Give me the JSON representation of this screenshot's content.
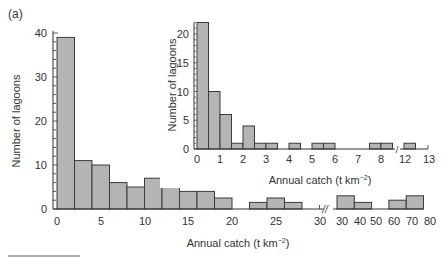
{
  "chart_data": [
    {
      "panel": "(a)",
      "type": "bar",
      "title": "",
      "xlabel": "Annual catch (t km−2)",
      "ylabel": "Number of lagoons",
      "ylim": [
        0,
        40
      ],
      "yticks": [
        0,
        10,
        20,
        30,
        40
      ],
      "xticks": [
        "0",
        "5",
        "10",
        "15",
        "20",
        "25",
        "30",
        "30",
        "40",
        "50",
        "60",
        "70",
        "80"
      ],
      "axis_break": "between 30 and 30 (scale changes from 2-unit bins to 10-unit bins)",
      "bins": [
        "0-2",
        "2-4",
        "4-6",
        "6-8",
        "8-10",
        "10-12",
        "12-14",
        "14-16",
        "16-18",
        "18-20",
        "20-22",
        "22-24",
        "24-26",
        "26-28",
        "30-40",
        "40-50",
        "50-60",
        "60-70",
        "70-80"
      ],
      "values": [
        39,
        11,
        10,
        6,
        5,
        7,
        5.5,
        4,
        4,
        2.5,
        0,
        1.5,
        2.5,
        1.5,
        3,
        1.5,
        0,
        2,
        3
      ],
      "grid": false
    },
    {
      "panel": "(b)",
      "type": "bar",
      "title": "",
      "xlabel": "Annual catch (t km−2)",
      "ylabel": "Number of lagoons",
      "ylim": [
        0,
        22
      ],
      "yticks": [
        0,
        5,
        10,
        15,
        20
      ],
      "xticks": [
        "0",
        "1",
        "2",
        "3",
        "4",
        "5",
        "6",
        "7",
        "8",
        "12",
        "13"
      ],
      "axis_break": "between 8 and 12",
      "bins": [
        "0-0.5",
        "0.5-1",
        "1-1.5",
        "1.5-2",
        "2-2.5",
        "2.5-3",
        "3-3.5",
        "3.5-4",
        "4-4.5",
        "4.5-5",
        "5-5.5",
        "5.5-6",
        "6-6.5",
        "6.5-7",
        "7-7.5",
        "7.5-8",
        "8-8.5",
        "12-12.5"
      ],
      "values": [
        22,
        10,
        6,
        1,
        4,
        1,
        1,
        0,
        1,
        0,
        1,
        1,
        0,
        0,
        0,
        1,
        1,
        1
      ],
      "grid": false
    }
  ],
  "labels": {
    "panel_a": "(a)",
    "panel_b": "(b)",
    "ylabel_a": "Number of lagoons",
    "ylabel_b": "Number of lagoons",
    "xlabel_a": "Annual catch (t km",
    "xlabel_b": "Annual catch (t km",
    "xlabel_sup": "−2",
    "xlabel_close": ")"
  },
  "colors": {
    "bar_fill": "#b4b4b4",
    "bar_stroke": "#3a3a3a",
    "axis": "#333333"
  }
}
